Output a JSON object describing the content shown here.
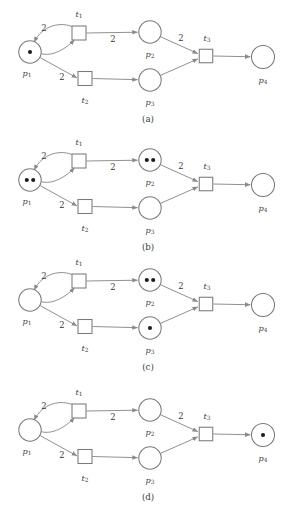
{
  "figure": {
    "colors": {
      "background": "#ffffff",
      "stroke": "#8a8a8a",
      "node_stroke": "#7a7a7a",
      "token": "#1b1b1b",
      "text": "#3a3a3a"
    }
  },
  "node_labels": {
    "p1": {
      "base": "p",
      "sub": "1"
    },
    "p2": {
      "base": "p",
      "sub": "2"
    },
    "p3": {
      "base": "p",
      "sub": "3"
    },
    "p4": {
      "base": "p",
      "sub": "4"
    },
    "t1": {
      "base": "t",
      "sub": "1"
    },
    "t2": {
      "base": "t",
      "sub": "2"
    },
    "t3": {
      "base": "t",
      "sub": "3"
    }
  },
  "arc_weights": {
    "t1_to_p1": "2",
    "p1_to_t1": "",
    "t1_to_p2": "2",
    "p1_to_t2": "2",
    "t2_to_p3": "",
    "p2_to_t3": "2",
    "p3_to_t3": "",
    "t3_to_p4": ""
  },
  "panels": [
    {
      "id": "a",
      "label": "(a)",
      "tokens": {
        "p1": 1,
        "p2": 0,
        "p3": 0,
        "p4": 0
      }
    },
    {
      "id": "b",
      "label": "(b)",
      "tokens": {
        "p1": 2,
        "p2": 2,
        "p3": 0,
        "p4": 0
      }
    },
    {
      "id": "c",
      "label": "(c)",
      "tokens": {
        "p1": 0,
        "p2": 2,
        "p3": 1,
        "p4": 0
      }
    },
    {
      "id": "d",
      "label": "(d)",
      "tokens": {
        "p1": 0,
        "p2": 0,
        "p3": 0,
        "p4": 1
      }
    }
  ]
}
